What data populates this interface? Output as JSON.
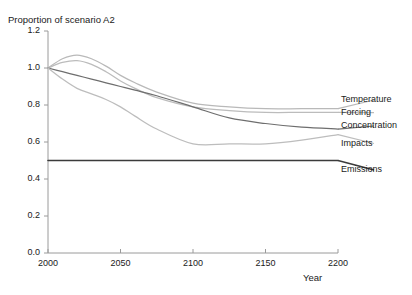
{
  "chart_data": {
    "type": "line",
    "title": "Proportion of scenario A2",
    "xlabel": "Year",
    "ylabel": "Proportion of scenario A2",
    "xlim": [
      2000,
      2200
    ],
    "ylim": [
      0.0,
      1.2
    ],
    "xticks": [
      2000,
      2050,
      2100,
      2150,
      2200
    ],
    "xtick_labels": [
      "2000",
      "2050",
      "2100",
      "2150",
      "2200"
    ],
    "yticks": [
      0.0,
      0.2,
      0.4,
      0.6,
      0.8,
      1.0,
      1.2
    ],
    "ytick_labels": [
      "0.0",
      "0.2",
      "0.4",
      "0.6",
      "0.8",
      "1.0",
      "1.2"
    ],
    "grid": false,
    "legend_position": "right-of-axes-at-line-end",
    "x": [
      2000,
      2010,
      2020,
      2030,
      2040,
      2050,
      2060,
      2075,
      2100,
      2125,
      2150,
      2175,
      2200
    ],
    "series": [
      {
        "name": "Temperature",
        "color": "#b9b9b9",
        "values": [
          1.0,
          1.05,
          1.07,
          1.05,
          1.01,
          0.96,
          0.92,
          0.87,
          0.81,
          0.79,
          0.78,
          0.78,
          0.78
        ]
      },
      {
        "name": "Forcing",
        "color": "#bcbcbc",
        "values": [
          1.0,
          1.03,
          1.04,
          1.02,
          0.98,
          0.93,
          0.89,
          0.84,
          0.79,
          0.77,
          0.76,
          0.76,
          0.76
        ]
      },
      {
        "name": "Concentration",
        "color": "#6e6e6e",
        "values": [
          1.0,
          0.98,
          0.96,
          0.94,
          0.92,
          0.9,
          0.88,
          0.85,
          0.79,
          0.73,
          0.7,
          0.68,
          0.67
        ]
      },
      {
        "name": "Impacts",
        "color": "#bdbdbd",
        "values": [
          1.0,
          0.94,
          0.89,
          0.86,
          0.83,
          0.79,
          0.74,
          0.67,
          0.59,
          0.59,
          0.59,
          0.61,
          0.64
        ]
      },
      {
        "name": "Emissions",
        "color": "#3b3b3b",
        "values": [
          0.5,
          0.5,
          0.5,
          0.5,
          0.5,
          0.5,
          0.5,
          0.5,
          0.5,
          0.5,
          0.5,
          0.5,
          0.5
        ]
      }
    ],
    "legend_entries": [
      {
        "label": "Temperature"
      },
      {
        "label": "Forcing"
      },
      {
        "label": "Concentration"
      },
      {
        "label": "Impacts"
      },
      {
        "label": "Emissions"
      }
    ]
  },
  "axes": {
    "axis_color": "#9a9a9a",
    "text_color": "#1a1a1a"
  }
}
